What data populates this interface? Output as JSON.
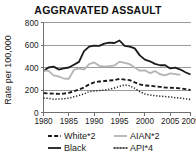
{
  "chart_data": {
    "type": "line",
    "title": "AGGRAVATED ASSAULT",
    "xlabel": "",
    "ylabel": "Rate per 100,000",
    "xlim": [
      1980,
      2009
    ],
    "ylim": [
      0,
      800
    ],
    "yticks": [
      0,
      200,
      400,
      600,
      800
    ],
    "xticks": [
      1980,
      1985,
      1990,
      1995,
      2000,
      2005,
      2009
    ],
    "grid": true,
    "legend_position": "bottom",
    "x": [
      1980,
      1981,
      1982,
      1983,
      1984,
      1985,
      1986,
      1987,
      1988,
      1989,
      1990,
      1991,
      1992,
      1993,
      1994,
      1995,
      1996,
      1997,
      1998,
      1999,
      2000,
      2001,
      2002,
      2003,
      2004,
      2005,
      2006,
      2007,
      2008,
      2009
    ],
    "series": [
      {
        "name": "White*2",
        "style": "dashed",
        "color": "#1a1a1a",
        "values": [
          172,
          170,
          168,
          166,
          168,
          175,
          190,
          205,
          222,
          250,
          268,
          275,
          280,
          284,
          288,
          300,
          292,
          288,
          268,
          250,
          240,
          238,
          232,
          228,
          222,
          220,
          218,
          214,
          208,
          200
        ]
      },
      {
        "name": "Black",
        "style": "solid",
        "color": "#1a1a1a",
        "values": [
          368,
          400,
          408,
          382,
          392,
          400,
          425,
          450,
          545,
          585,
          595,
          592,
          612,
          622,
          618,
          640,
          592,
          585,
          570,
          508,
          470,
          455,
          432,
          420,
          420,
          392,
          398,
          382,
          358,
          338
        ]
      },
      {
        "name": "AIAN*2",
        "style": "solid",
        "color": "#b4b4b4",
        "values": [
          372,
          370,
          330,
          320,
          302,
          300,
          378,
          392,
          382,
          430,
          445,
          415,
          408,
          412,
          418,
          452,
          442,
          430,
          400,
          372,
          375,
          350,
          368,
          340,
          330,
          348,
          342,
          335,
          null,
          null
        ]
      },
      {
        "name": "API*4",
        "style": "dotted",
        "color": "#1a1a1a",
        "values": [
          130,
          125,
          118,
          120,
          122,
          128,
          140,
          152,
          165,
          185,
          192,
          195,
          198,
          208,
          218,
          232,
          245,
          238,
          215,
          185,
          165,
          155,
          150,
          145,
          142,
          138,
          132,
          128,
          122,
          115
        ]
      }
    ]
  },
  "legend": {
    "items": [
      {
        "label": "White*2",
        "style": "dashed",
        "color": "#1a1a1a"
      },
      {
        "label": "AIAN*2",
        "style": "solid",
        "color": "#b4b4b4"
      },
      {
        "label": "Black",
        "style": "solid",
        "color": "#1a1a1a"
      },
      {
        "label": "API*4",
        "style": "dotted",
        "color": "#1a1a1a"
      }
    ]
  }
}
